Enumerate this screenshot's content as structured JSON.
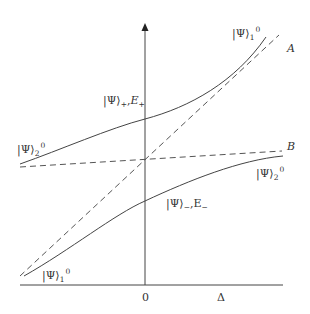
{
  "figure": {
    "type": "energy-level avoided crossing diagram",
    "colors": {
      "line": "#444444",
      "text": "#333333",
      "background": "#ffffff"
    },
    "axes": {
      "x_axis_label": "Δ",
      "origin_label": "0",
      "y_axis_arrow": "arrow-up"
    },
    "lines": {
      "diabatic_A_label": "A",
      "diabatic_B_label": "B"
    },
    "labels": {
      "upper_right": {
        "ket": "|Ψ⟩",
        "sub": "1",
        "sup": "0"
      },
      "upper_mid": {
        "ket": "|Ψ⟩",
        "sub": "+",
        "sep": ",",
        "energy": "E",
        "energy_sub": "+"
      },
      "left_upper": {
        "ket": "|Ψ⟩",
        "sub": "2",
        "sup": "0"
      },
      "right_lower": {
        "ket": "|Ψ⟩",
        "sub": "2",
        "sup": "0"
      },
      "lower_mid": {
        "ket": "|Ψ⟩",
        "sub": "−",
        "sep": ",",
        "energy": "E",
        "energy_sub": "−"
      },
      "lower_left": {
        "ket": "|Ψ⟩",
        "sub": "1",
        "sup": "0"
      }
    }
  }
}
